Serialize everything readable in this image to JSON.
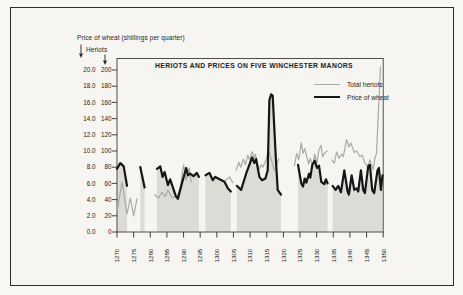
{
  "chart_data": {
    "type": "line",
    "title": "HERIOTS AND PRICES ON FIVE WINCHESTER MANORS",
    "legend": [
      {
        "name": "Total heriots",
        "color": "#a9a9a5",
        "stroke_width": 1.2
      },
      {
        "name": "Price of wheat",
        "color": "#161616",
        "stroke_width": 2.2
      }
    ],
    "axes": {
      "x": {
        "range": [
          1270,
          1350
        ],
        "tick_labels": [
          "1270",
          "1275",
          "1280",
          "1285",
          "1290",
          "1295",
          "1300",
          "1305",
          "1310",
          "1315",
          "1320",
          "1325",
          "1330",
          "1335",
          "1340",
          "1345",
          "1350"
        ]
      },
      "y_wheat": {
        "label": "Price of wheat (shillings per quarter)",
        "range": [
          0,
          20
        ],
        "tick_labels": [
          "0.0",
          "2.0",
          "4.0",
          "6.0",
          "8.0",
          "10.0",
          "12.0",
          "14.0",
          "16.0",
          "18.0",
          "20.0"
        ]
      },
      "y_heriots": {
        "label": "Heriots",
        "range": [
          0,
          200
        ],
        "tick_labels": [
          "0",
          "20",
          "40",
          "60",
          "80",
          "100",
          "120",
          "140",
          "160",
          "180",
          "200"
        ]
      }
    },
    "series": [
      {
        "name": "Total heriots",
        "axis": "heriots",
        "color": "#a9a9a5",
        "stroke_width": 1.2,
        "segments": [
          [
            [
              1270,
              25
            ],
            [
              1271.5,
              62
            ],
            [
              1273,
              22
            ],
            [
              1274,
              42
            ],
            [
              1275,
              20
            ],
            [
              1276,
              41
            ]
          ],
          [
            [
              1281.3,
              46
            ],
            [
              1282.5,
              42
            ],
            [
              1283.5,
              49
            ],
            [
              1284.5,
              44
            ],
            [
              1285.3,
              52
            ],
            [
              1286.5,
              42
            ],
            [
              1288,
              44
            ],
            [
              1289,
              54
            ],
            [
              1290,
              83
            ],
            [
              1290.8,
              64
            ],
            [
              1291.7,
              79
            ],
            [
              1292.3,
              62
            ]
          ],
          [
            [
              1302.6,
              64
            ],
            [
              1303.8,
              68
            ],
            [
              1304.8,
              61
            ]
          ],
          [
            [
              1305.8,
              76
            ],
            [
              1306.6,
              86
            ],
            [
              1307.2,
              80
            ],
            [
              1308,
              90
            ],
            [
              1308.6,
              83
            ],
            [
              1309.3,
              95
            ],
            [
              1309.8,
              89
            ],
            [
              1310.6,
              99
            ],
            [
              1311.3,
              91
            ],
            [
              1311.6,
              96
            ],
            [
              1312.6,
              77
            ],
            [
              1313.3,
              83
            ],
            [
              1313.8,
              80
            ],
            [
              1314.8,
              89
            ],
            [
              1315.5,
              101
            ],
            [
              1316.5,
              88
            ],
            [
              1317.3,
              76
            ],
            [
              1318,
              83
            ],
            [
              1318.6,
              90
            ]
          ],
          [
            [
              1323.3,
              82
            ],
            [
              1324,
              97
            ],
            [
              1324.6,
              89
            ],
            [
              1325.4,
              110
            ],
            [
              1325.9,
              97
            ],
            [
              1326.4,
              103
            ],
            [
              1327.6,
              84
            ],
            [
              1328.1,
              91
            ],
            [
              1328.8,
              81
            ],
            [
              1329.4,
              96
            ],
            [
              1330.1,
              85
            ],
            [
              1330.6,
              100
            ],
            [
              1331.3,
              107
            ],
            [
              1331.8,
              93
            ],
            [
              1332.5,
              98
            ],
            [
              1333.2,
              100
            ]
          ],
          [
            [
              1334.5,
              89
            ],
            [
              1335.3,
              85
            ],
            [
              1336,
              99
            ],
            [
              1336.7,
              91
            ],
            [
              1337.5,
              96
            ],
            [
              1338,
              93
            ],
            [
              1339,
              114
            ],
            [
              1339.7,
              105
            ],
            [
              1340.3,
              110
            ],
            [
              1341.3,
              98
            ],
            [
              1342,
              100
            ],
            [
              1343,
              93
            ],
            [
              1343.7,
              95
            ],
            [
              1344.5,
              85
            ],
            [
              1345.3,
              81
            ],
            [
              1346,
              89
            ],
            [
              1347,
              77
            ],
            [
              1347.5,
              91
            ],
            [
              1348,
              97
            ],
            [
              1349.2,
              204
            ]
          ]
        ]
      },
      {
        "name": "Price of wheat",
        "axis": "wheat",
        "color": "#161616",
        "stroke_width": 2.2,
        "area_fill": "#dcdcd7",
        "segments": [
          [
            [
              1270,
              7.8
            ],
            [
              1271,
              8.5
            ],
            [
              1272,
              8.1
            ],
            [
              1273,
              5.7
            ]
          ],
          [
            [
              1277,
              8.0
            ],
            [
              1278.3,
              5.5
            ]
          ],
          [
            [
              1282,
              7.8
            ],
            [
              1283,
              8.1
            ],
            [
              1283.7,
              6.8
            ],
            [
              1284.3,
              7.4
            ],
            [
              1285.3,
              5.8
            ],
            [
              1286,
              6.5
            ],
            [
              1287.7,
              4.4
            ],
            [
              1288.3,
              4.1
            ],
            [
              1289.5,
              6.0
            ],
            [
              1290.8,
              7.9
            ],
            [
              1291.3,
              7.0
            ],
            [
              1292,
              7.2
            ],
            [
              1293,
              6.9
            ],
            [
              1294,
              7.3
            ],
            [
              1294.6,
              6.8
            ]
          ],
          [
            [
              1296.6,
              7.0
            ],
            [
              1297.8,
              7.3
            ],
            [
              1298.8,
              6.4
            ],
            [
              1299.5,
              6.8
            ],
            [
              1300.8,
              6.5
            ],
            [
              1302.3,
              6.2
            ],
            [
              1303.3,
              5.4
            ],
            [
              1304.2,
              5.0
            ]
          ],
          [
            [
              1306,
              5.7
            ],
            [
              1307.3,
              5.2
            ],
            [
              1308.8,
              7.2
            ],
            [
              1310.6,
              9.2
            ],
            [
              1311.3,
              8.5
            ],
            [
              1311.8,
              9.0
            ],
            [
              1312.8,
              6.8
            ],
            [
              1313.6,
              6.4
            ],
            [
              1314.6,
              6.6
            ],
            [
              1315.3,
              7.6
            ],
            [
              1315.8,
              16.3
            ],
            [
              1316.3,
              17.0
            ],
            [
              1316.8,
              16.8
            ],
            [
              1317.3,
              12.6
            ],
            [
              1317.8,
              8.5
            ],
            [
              1318.3,
              5.2
            ],
            [
              1319.3,
              4.6
            ]
          ],
          [
            [
              1324.4,
              8.3
            ],
            [
              1325.4,
              6.0
            ],
            [
              1325.9,
              5.6
            ],
            [
              1326.4,
              6.6
            ],
            [
              1326.9,
              6.1
            ],
            [
              1327.7,
              7.2
            ],
            [
              1328.1,
              6.7
            ],
            [
              1328.7,
              8.3
            ],
            [
              1329.4,
              8.8
            ],
            [
              1330.1,
              7.9
            ],
            [
              1330.7,
              8.2
            ],
            [
              1331.4,
              6.2
            ],
            [
              1332.3,
              5.9
            ],
            [
              1332.8,
              6.5
            ],
            [
              1333.3,
              6.0
            ]
          ],
          [
            [
              1334.8,
              5.7
            ],
            [
              1335.7,
              5.2
            ],
            [
              1336.5,
              5.7
            ],
            [
              1337.3,
              4.9
            ],
            [
              1338.3,
              7.6
            ],
            [
              1339.3,
              5.0
            ],
            [
              1339.7,
              4.6
            ],
            [
              1340.5,
              7.0
            ],
            [
              1341.3,
              5.2
            ],
            [
              1342,
              5.4
            ],
            [
              1342.5,
              5.0
            ],
            [
              1343.3,
              7.6
            ],
            [
              1344,
              5.2
            ],
            [
              1344.5,
              4.8
            ],
            [
              1345.5,
              8.1
            ],
            [
              1346,
              8.3
            ],
            [
              1346.7,
              5.2
            ],
            [
              1347.3,
              4.8
            ],
            [
              1348.3,
              7.6
            ],
            [
              1348.7,
              7.9
            ],
            [
              1349.3,
              5.2
            ],
            [
              1349.8,
              7.0
            ]
          ]
        ]
      }
    ]
  }
}
